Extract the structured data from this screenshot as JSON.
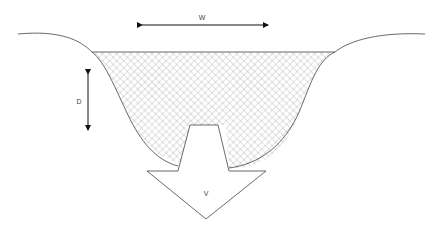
{
  "diagram": {
    "labels": {
      "width": "W",
      "depth": "D",
      "velocity": "V"
    },
    "colors": {
      "stroke": "#444444",
      "arrow": "#111111",
      "hatch": "#9a9a9a",
      "background": "#ffffff"
    }
  }
}
